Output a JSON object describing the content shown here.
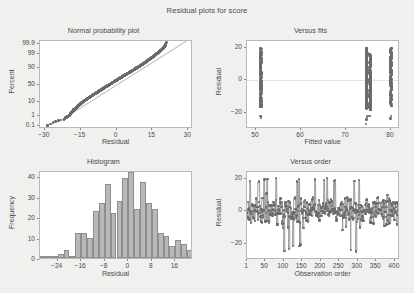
{
  "figure": {
    "title": "Residual plots for score",
    "background": "#f0f0ef",
    "point_color": "#6b6b6b",
    "bar_color": "#b8b8b8",
    "bar_edge_color": "#8e8e8e",
    "reference_line_color": "#bdbdbd"
  },
  "chart_data": [
    {
      "type": "scatter",
      "id": "normal-probability-plot",
      "title": "Normal probability plot",
      "xlabel": "Residual",
      "ylabel": "Percent",
      "xlim": [
        -32,
        32
      ],
      "ylim_percent": [
        0.05,
        99.95
      ],
      "xticks": [
        -30,
        -15,
        0,
        15,
        30
      ],
      "yticks": [
        0.1,
        1,
        10,
        50,
        90,
        99,
        99.9
      ],
      "grid": false,
      "reference_line": true,
      "n_points": 414,
      "note": "Points follow a straight reference line; slight S-curvature at the upper tail near residual 20.",
      "points": [
        [
          -28.8,
          0.12
        ],
        [
          -22.0,
          0.5
        ],
        [
          -21.2,
          0.7
        ],
        [
          -20.5,
          0.9
        ],
        [
          -19.8,
          1.1
        ],
        [
          -19.4,
          1.4
        ],
        [
          -19.0,
          1.8
        ],
        [
          -18.6,
          2.2
        ],
        [
          -18.2,
          2.6
        ],
        [
          -17.9,
          3.2
        ],
        [
          -17.2,
          3.8
        ],
        [
          -16.8,
          4.4
        ],
        [
          -16.4,
          5.2
        ],
        [
          -16.0,
          6.0
        ],
        [
          -15.6,
          6.8
        ],
        [
          -15.2,
          7.6
        ],
        [
          -14.8,
          8.6
        ],
        [
          -14.4,
          9.6
        ],
        [
          -14.0,
          10.6
        ],
        [
          -13.5,
          11.8
        ],
        [
          -13.0,
          13.0
        ],
        [
          -12.5,
          14.4
        ],
        [
          -12.0,
          15.8
        ],
        [
          -11.5,
          17.3
        ],
        [
          -11.0,
          18.8
        ],
        [
          -10.5,
          20.4
        ],
        [
          -10.0,
          22.0
        ],
        [
          -9.5,
          23.8
        ],
        [
          -9.0,
          25.6
        ],
        [
          -8.5,
          27.4
        ],
        [
          -8.0,
          29.4
        ],
        [
          -7.5,
          31.4
        ],
        [
          -7.0,
          33.4
        ],
        [
          -6.5,
          35.6
        ],
        [
          -6.0,
          37.8
        ],
        [
          -5.5,
          40.0
        ],
        [
          -5.0,
          42.2
        ],
        [
          -4.5,
          44.4
        ],
        [
          -4.0,
          46.6
        ],
        [
          -3.5,
          48.8
        ],
        [
          -3.0,
          51.0
        ],
        [
          -2.5,
          53.2
        ],
        [
          -2.0,
          55.4
        ],
        [
          -1.5,
          57.6
        ],
        [
          -1.0,
          59.8
        ],
        [
          -0.5,
          62.0
        ],
        [
          0.0,
          64.0
        ],
        [
          0.5,
          66.0
        ],
        [
          1.0,
          68.0
        ],
        [
          1.5,
          70.0
        ],
        [
          2.0,
          71.8
        ],
        [
          2.5,
          73.6
        ],
        [
          3.0,
          75.4
        ],
        [
          3.5,
          77.0
        ],
        [
          4.0,
          78.6
        ],
        [
          4.5,
          80.2
        ],
        [
          5.0,
          81.6
        ],
        [
          5.5,
          83.0
        ],
        [
          6.0,
          84.3
        ],
        [
          6.5,
          85.6
        ],
        [
          7.0,
          86.8
        ],
        [
          7.5,
          87.9
        ],
        [
          8.0,
          89.0
        ],
        [
          8.5,
          90.0
        ],
        [
          9.0,
          90.9
        ],
        [
          9.5,
          91.8
        ],
        [
          10.0,
          92.6
        ],
        [
          10.5,
          93.4
        ],
        [
          11.0,
          94.1
        ],
        [
          11.5,
          94.8
        ],
        [
          12.0,
          95.4
        ],
        [
          12.5,
          96.0
        ],
        [
          13.0,
          96.5
        ],
        [
          13.5,
          97.0
        ],
        [
          14.0,
          97.4
        ],
        [
          14.5,
          97.8
        ],
        [
          15.0,
          98.1
        ],
        [
          15.5,
          98.4
        ],
        [
          16.0,
          98.7
        ],
        [
          16.5,
          98.9
        ],
        [
          17.0,
          99.1
        ],
        [
          17.5,
          99.25
        ],
        [
          18.0,
          99.4
        ],
        [
          18.5,
          99.5
        ],
        [
          19.0,
          99.6
        ],
        [
          19.5,
          99.7
        ],
        [
          20.0,
          99.78
        ],
        [
          20.5,
          99.86
        ],
        [
          20.8,
          99.92
        ]
      ]
    },
    {
      "type": "scatter",
      "id": "versus-fits",
      "title": "Versus fits",
      "xlabel": "Fitted value",
      "ylabel": "Residual",
      "xlim": [
        48,
        82
      ],
      "ylim": [
        -30,
        24
      ],
      "xticks": [
        50,
        60,
        70,
        80
      ],
      "yticks": [
        -20,
        0,
        20
      ],
      "grid": false,
      "zero_line": true,
      "note": "Residuals fall in three discrete vertical strips of fitted values near 51, 74.5-75.5 and 80.",
      "fitted_groups": [
        {
          "fitted": 51.1,
          "residual_range": [
            -16.5,
            19.5
          ],
          "outliers": [
            -22.0,
            -23.0
          ]
        },
        {
          "fitted": 74.6,
          "residual_range": [
            -17.5,
            19.8
          ],
          "outliers": [
            -22.5,
            -24.0,
            -27.0
          ]
        },
        {
          "fitted": 75.4,
          "residual_range": [
            -18.5,
            16.0
          ],
          "outliers": [
            -22.0
          ]
        },
        {
          "fitted": 80.0,
          "residual_range": [
            -16.0,
            19.8
          ],
          "outliers": [
            -22.0,
            -23.5
          ]
        }
      ]
    },
    {
      "type": "bar",
      "id": "histogram",
      "title": "Histogram",
      "xlabel": "Residual",
      "ylabel": "Frequency",
      "xticks": [
        -24,
        -16,
        -8,
        0,
        8,
        16
      ],
      "yticks": [
        0,
        10,
        20,
        30,
        40
      ],
      "ylim": [
        0,
        43
      ],
      "xlim": [
        -30,
        22
      ],
      "bin_width": 2,
      "grid": false,
      "bin_centers": [
        -29,
        -27,
        -25,
        -23,
        -21,
        -19,
        -17,
        -15,
        -13,
        -11,
        -9,
        -7,
        -5,
        -3,
        -1,
        1,
        3,
        5,
        7,
        9,
        11,
        13,
        15,
        17,
        19,
        21
      ],
      "values": [
        1,
        1,
        1,
        2,
        4,
        1,
        12,
        12,
        10,
        23,
        27,
        36,
        22,
        28,
        39,
        42,
        24,
        37,
        27,
        24,
        12,
        11,
        6,
        9,
        7,
        4
      ]
    },
    {
      "type": "line",
      "id": "versus-order",
      "title": "Versus order",
      "xlabel": "Observation order",
      "ylabel": "Residual",
      "xticks": [
        1,
        50,
        100,
        150,
        200,
        250,
        300,
        350,
        400
      ],
      "yticks": [
        -20,
        0,
        20
      ],
      "xlim": [
        1,
        414
      ],
      "ylim": [
        -30,
        24
      ],
      "grid": false,
      "zero_line": true,
      "connected_points": true,
      "n_points": 414,
      "note": "Residuals scattered randomly about zero across the full observation order, mostly within +/-15 with occasional spikes to +/-20 and a few below -25."
    }
  ]
}
